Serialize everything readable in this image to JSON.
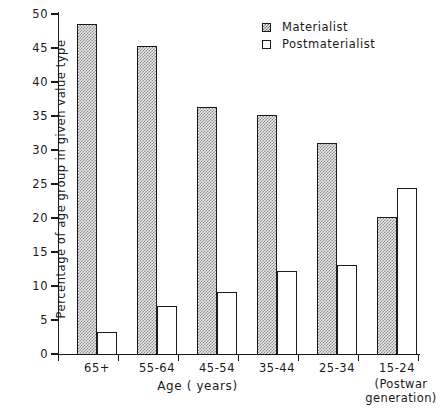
{
  "chart_data": {
    "type": "bar",
    "title": "",
    "xlabel": "Age ( years)",
    "ylabel": "Percentage of age group in given value type",
    "categories": [
      "65+",
      "55-64",
      "45-54",
      "35-44",
      "25-34",
      "15-24"
    ],
    "category_sublabels": [
      "",
      "",
      "",
      "",
      "",
      "(Postwar\ngeneration)"
    ],
    "series": [
      {
        "name": "Materialist",
        "values": [
          48.6,
          45.3,
          36.3,
          35.2,
          31.1,
          20.2
        ],
        "fill": "checkerboard-hatch",
        "color": "#e9e9e9"
      },
      {
        "name": "Postmaterialist",
        "values": [
          3.3,
          7.1,
          9.1,
          12.2,
          13.1,
          24.4
        ],
        "fill": "empty",
        "color": "#ffffff"
      }
    ],
    "ylim": [
      0,
      50
    ],
    "yticks": [
      0,
      5,
      10,
      15,
      20,
      25,
      30,
      35,
      40,
      45,
      50
    ],
    "ytick_labels": [
      "0",
      "5",
      "10",
      "15",
      "20",
      "25",
      "30",
      "35",
      "40",
      "45",
      "50"
    ],
    "grid": false,
    "legend_position": "top-right",
    "axis_color": "#1a1a1a"
  },
  "legend": {
    "items": [
      {
        "label": "Materialist",
        "swatch": "hatched-square-icon"
      },
      {
        "label": "Postmaterialist",
        "swatch": "empty-square-icon"
      }
    ]
  },
  "axes": {
    "x_title": "Age ( years)",
    "y_title": "Percentage of age group in given value type",
    "postwar_line1": "(Postwar",
    "postwar_line2": "generation)"
  }
}
